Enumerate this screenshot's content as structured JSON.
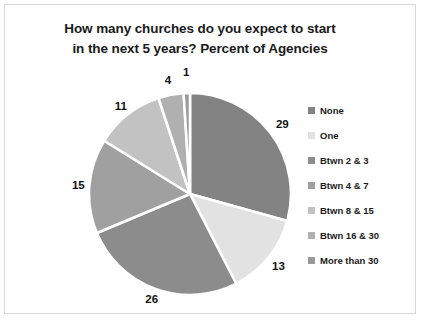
{
  "chart_data": {
    "type": "pie",
    "title": "How many churches do you expect to start in the next 5 years? Percent of Agencies",
    "title_line1": "How many churches do you expect to start",
    "title_line2": "in the next 5 years? Percent of Agencies",
    "categories": [
      "None",
      "One",
      "Btwn 2 & 3",
      "Btwn 4 & 7",
      "Btwn 8 & 15",
      "Btwn 16 & 30",
      "More than 30"
    ],
    "values": [
      29,
      13,
      26,
      15,
      11,
      4,
      1
    ],
    "labels": [
      "29",
      "13",
      "26",
      "15",
      "11",
      "4",
      "1"
    ],
    "colors": [
      "#838383",
      "#e2e2e2",
      "#8c8c8c",
      "#a0a0a0",
      "#c2c2c2",
      "#b0b0b0",
      "#9a9a9a"
    ],
    "legend_position": "right",
    "grid": false,
    "xlabel": "",
    "ylabel": "",
    "units": "percent",
    "slice_gap_color": "#ffffff"
  },
  "legend": {
    "items": [
      {
        "label": "None",
        "color": "#838383",
        "value": 29
      },
      {
        "label": "One",
        "color": "#e2e2e2",
        "value": 13
      },
      {
        "label": "Btwn 2 & 3",
        "color": "#8c8c8c",
        "value": 26
      },
      {
        "label": "Btwn 4 & 7",
        "color": "#a0a0a0",
        "value": 15
      },
      {
        "label": "Btwn 8 & 15",
        "color": "#c2c2c2",
        "value": 11
      },
      {
        "label": "Btwn 16 & 30",
        "color": "#b0b0b0",
        "value": 4
      },
      {
        "label": "More than 30",
        "color": "#9a9a9a",
        "value": 1
      }
    ]
  }
}
